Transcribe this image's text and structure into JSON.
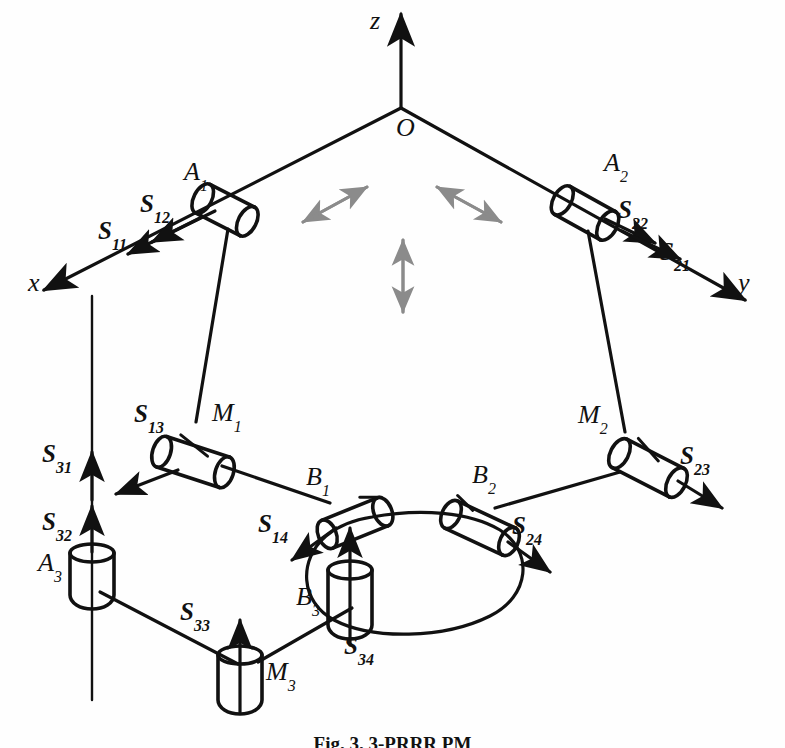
{
  "figure": {
    "caption_prefix": "Fig. 3.",
    "caption_text": "3-PRRR PM",
    "caption_full": "Fig. 3. 3-PRRR PM"
  },
  "axes": {
    "x_label": "x",
    "y_label": "y",
    "z_label": "z",
    "origin_label": "O"
  },
  "joints": {
    "a1": {
      "base": "A",
      "sub": "1"
    },
    "a2": {
      "base": "A",
      "sub": "2"
    },
    "a3": {
      "base": "A",
      "sub": "3"
    },
    "m1": {
      "base": "M",
      "sub": "1"
    },
    "m2": {
      "base": "M",
      "sub": "2"
    },
    "m3": {
      "base": "M",
      "sub": "3"
    },
    "b1": {
      "base": "B",
      "sub": "1"
    },
    "b2": {
      "base": "B",
      "sub": "2"
    },
    "b3": {
      "base": "B",
      "sub": "3"
    }
  },
  "screws": {
    "s11": {
      "base": "S",
      "sub": "11"
    },
    "s12": {
      "base": "S",
      "sub": "12"
    },
    "s13": {
      "base": "S",
      "sub": "13"
    },
    "s14": {
      "base": "S",
      "sub": "14"
    },
    "s21": {
      "base": "S",
      "sub": "21"
    },
    "s22": {
      "base": "S",
      "sub": "22"
    },
    "s23": {
      "base": "S",
      "sub": "23"
    },
    "s24": {
      "base": "S",
      "sub": "24"
    },
    "s31": {
      "base": "S",
      "sub": "31"
    },
    "s32": {
      "base": "S",
      "sub": "32"
    },
    "s33": {
      "base": "S",
      "sub": "33"
    },
    "s34": {
      "base": "S",
      "sub": "34"
    }
  },
  "colors": {
    "ink": "#111111",
    "dof_arrow": "#7a7a7a",
    "background": "#ffffff"
  },
  "dof_arrows": [
    {
      "name": "dof-arrow-left",
      "direction": "diagonal-up-right"
    },
    {
      "name": "dof-arrow-right",
      "direction": "diagonal-up-left"
    },
    {
      "name": "dof-arrow-center",
      "direction": "vertical"
    }
  ]
}
